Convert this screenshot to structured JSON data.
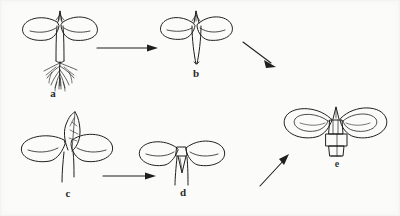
{
  "figure": {
    "type": "line-drawing",
    "subject": "seedling developmental stages",
    "background_color": "#fbfbfa",
    "ink_color": "#1f1f1f",
    "width": 400,
    "height": 216
  },
  "stages": [
    {
      "id": "a",
      "label": "a",
      "label_x": 52,
      "label_y": 93,
      "description": "seedling with two spread cotyledons, straight hypocotyl and fibrous root system",
      "has_roots": true,
      "leaf_count": 2
    },
    {
      "id": "b",
      "label": "b",
      "label_x": 190,
      "label_y": 73,
      "description": "seedling with two cotyledons and tapered stem, roots removed",
      "has_roots": false,
      "leaf_count": 2
    },
    {
      "id": "c",
      "label": "c",
      "label_x": 66,
      "label_y": 193,
      "description": "seedling with two cotyledons and an erect pointed first true leaf",
      "has_roots": false,
      "leaf_count": 3
    },
    {
      "id": "d",
      "label": "d",
      "label_x": 182,
      "label_y": 192,
      "description": "seedling with two cotyledons and narrow V-shaped shoot apex on a stem",
      "has_roots": false,
      "leaf_count": 2
    },
    {
      "id": "e",
      "label": "e",
      "label_x": 336,
      "label_y": 163,
      "description": "seedling with two broad cotyledons and a segmented scaly stem base",
      "has_roots": false,
      "leaf_count": 2
    }
  ],
  "arrows": [
    {
      "id": "arrow-a-b",
      "from": "a",
      "to": "b",
      "direction": "right",
      "x1": 97,
      "y1": 48,
      "x2": 150,
      "y2": 48
    },
    {
      "id": "arrow-b-d",
      "from": "b",
      "to": "d",
      "direction": "down-right",
      "x1": 243,
      "y1": 42,
      "x2": 275,
      "y2": 66
    },
    {
      "id": "arrow-c-d",
      "from": "c",
      "to": "d",
      "direction": "right",
      "x1": 103,
      "y1": 176,
      "x2": 156,
      "y2": 176
    },
    {
      "id": "arrow-d-e",
      "from": "d",
      "to": "e",
      "direction": "up-right",
      "x1": 260,
      "y1": 186,
      "x2": 289,
      "y2": 155
    }
  ],
  "caption": "Developmental stages a, b, c, d and e of a seedling"
}
